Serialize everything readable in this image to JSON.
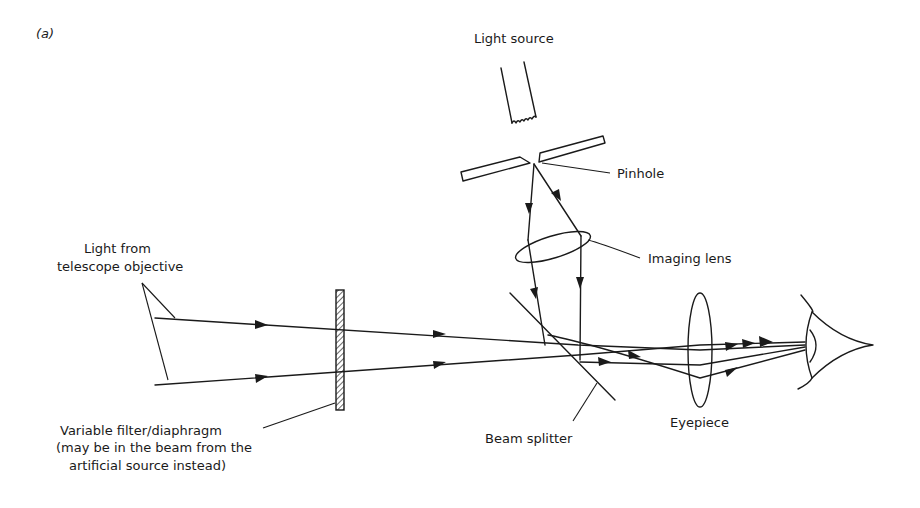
{
  "figure": {
    "panel_label": "(a)",
    "labels": {
      "light_source": "Light source",
      "pinhole": "Pinhole",
      "imaging_lens": "Imaging lens",
      "light_from_line1": "Light from",
      "light_from_line2": "telescope objective",
      "filter_line1": "Variable filter/diaphragm",
      "filter_line2": "(may be in the beam from the",
      "filter_line3": "artificial source instead)",
      "beam_splitter": "Beam splitter",
      "eyepiece": "Eyepiece"
    },
    "components": [
      "light-source",
      "pinhole",
      "imaging-lens",
      "variable-filter",
      "beam-splitter",
      "eyepiece",
      "eye"
    ],
    "colors": {
      "ink": "#1a1a1a",
      "background": "#ffffff"
    }
  }
}
